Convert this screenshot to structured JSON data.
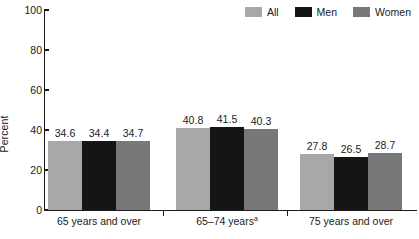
{
  "chart_data": {
    "type": "bar",
    "title": "",
    "subtitle": "",
    "xlabel": "",
    "ylabel": "Percent",
    "ylim": [
      0,
      100
    ],
    "yticks": [
      0,
      20,
      40,
      60,
      80,
      100
    ],
    "ytick_labels": [
      "0",
      "20",
      "40",
      "60",
      "80",
      "100"
    ],
    "grid": false,
    "legend_position": "top-right",
    "categories": [
      "65 years and over",
      "65–74 years",
      "75 years and over"
    ],
    "category_footnotes": [
      "",
      "a",
      ""
    ],
    "series": [
      {
        "name": "All",
        "color": "#a8a8a8",
        "values": [
          34.6,
          40.8,
          27.8
        ]
      },
      {
        "name": "Men",
        "color": "#151515",
        "values": [
          34.4,
          41.5,
          26.5
        ]
      },
      {
        "name": "Women",
        "color": "#787878",
        "values": [
          34.7,
          40.3,
          28.7
        ]
      }
    ],
    "value_labels": [
      [
        "34.6",
        "34.4",
        "34.7"
      ],
      [
        "40.8",
        "41.5",
        "40.3"
      ],
      [
        "27.8",
        "26.5",
        "28.7"
      ]
    ],
    "axis_color": "#1a1a1a",
    "background_color": "#ffffff"
  },
  "legend": {
    "items": [
      {
        "label": "All",
        "swatch_name": "legend-swatch-all",
        "color": "#a8a8a8"
      },
      {
        "label": "Men",
        "swatch_name": "legend-swatch-men",
        "color": "#151515"
      },
      {
        "label": "Women",
        "swatch_name": "legend-swatch-women",
        "color": "#787878"
      }
    ]
  }
}
